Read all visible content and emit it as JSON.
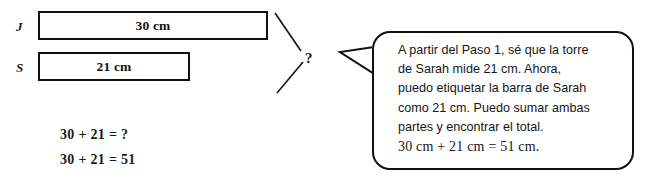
{
  "diagram": {
    "bars": [
      {
        "row_label": "J",
        "value_label": "30 cm",
        "name": "bar-jason"
      },
      {
        "row_label": "S",
        "value_label": "21 cm",
        "name": "bar-sarah"
      }
    ],
    "total_marker": "?",
    "equations": [
      "30 + 21 = ?",
      "30 + 21 = 51"
    ]
  },
  "bubble": {
    "lines": [
      "A partir del Paso 1, sé que la torre",
      "de Sarah mide 21 cm. Ahora,",
      "puedo etiquetar la barra de Sarah",
      "como 21 cm. Puedo sumar ambas",
      "partes y encontrar el total."
    ],
    "equation_line": "30 cm + 21 cm = 51 cm."
  },
  "colors": {
    "ink": "#111111",
    "background": "#ffffff"
  }
}
